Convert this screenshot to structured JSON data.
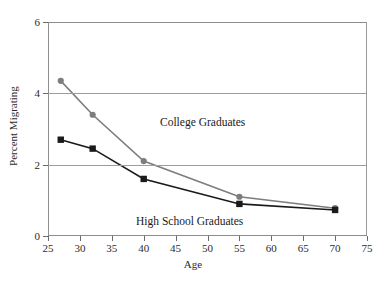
{
  "chart_data": {
    "type": "line",
    "title": "",
    "xlabel": "Age",
    "ylabel": "Percent Migrating",
    "xlim": [
      25,
      75
    ],
    "ylim": [
      0,
      6
    ],
    "xticks": [
      25,
      30,
      35,
      40,
      45,
      50,
      55,
      60,
      65,
      70,
      75
    ],
    "yticks": [
      0,
      2,
      4,
      6
    ],
    "grid": "horizontal",
    "legend_position": "inline-annotations",
    "x": [
      27,
      32,
      40,
      55,
      70
    ],
    "series": [
      {
        "name": "College Graduates",
        "values": [
          4.35,
          3.4,
          2.1,
          1.1,
          0.78
        ],
        "color": "#7d7d7d",
        "marker": "circle"
      },
      {
        "name": "High School Graduates",
        "values": [
          2.7,
          2.45,
          1.6,
          0.9,
          0.73
        ],
        "color": "#1a1a1a",
        "marker": "square"
      }
    ],
    "annotations": [
      {
        "text": "College Graduates",
        "x": 38,
        "y": 3.05
      },
      {
        "text": "High School Graduates",
        "x": 33,
        "y": 0.78
      }
    ]
  },
  "axis": {
    "x_title": "Age",
    "y_title": "Percent Migrating",
    "x_tick_labels": [
      "25",
      "30",
      "35",
      "40",
      "45",
      "50",
      "55",
      "60",
      "65",
      "70",
      "75"
    ],
    "y_tick_labels": [
      "0",
      "2",
      "4",
      "6"
    ]
  },
  "labels": {
    "college": "College Graduates",
    "high_school": "High School Graduates"
  },
  "colors": {
    "college_line": "#7d7d7d",
    "high_school_line": "#1a1a1a",
    "grid": "#9d9d9d",
    "frame": "#8e8e8e",
    "background": "#ffffff"
  }
}
